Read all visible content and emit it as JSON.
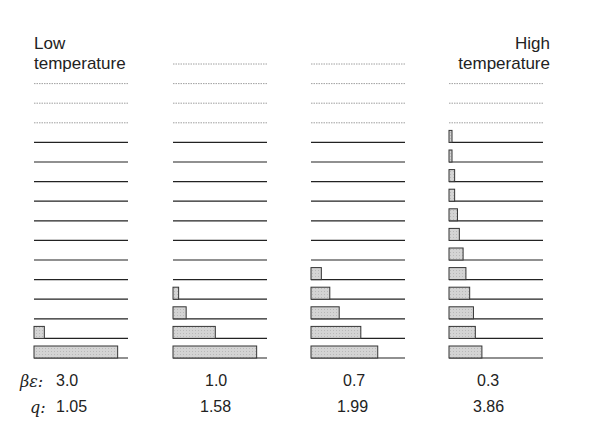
{
  "labels": {
    "low": [
      "Low",
      "temperature"
    ],
    "high": [
      "High",
      "temperature"
    ]
  },
  "rows": {
    "beta_epsilon_symbol": "βε:",
    "q_symbol": "q:"
  },
  "level_count": 16,
  "dotted_from_level": 12,
  "columns": [
    {
      "beta_epsilon": "3.0",
      "q": "1.05",
      "populations": [
        0.89,
        0.11,
        0,
        0,
        0,
        0,
        0,
        0,
        0,
        0,
        0,
        0,
        0,
        0,
        0,
        0
      ],
      "top_level": 14
    },
    {
      "beta_epsilon": "1.0",
      "q": "1.58",
      "populations": [
        0.89,
        0.45,
        0.14,
        0.06,
        0,
        0,
        0,
        0,
        0,
        0,
        0,
        0,
        0,
        0,
        0,
        0
      ],
      "top_level": 15
    },
    {
      "beta_epsilon": "0.7",
      "q": "1.99",
      "populations": [
        0.71,
        0.53,
        0.3,
        0.2,
        0.11,
        0,
        0,
        0,
        0,
        0,
        0,
        0,
        0,
        0,
        0,
        0
      ],
      "top_level": 15
    },
    {
      "beta_epsilon": "0.3",
      "q": "3.86",
      "populations": [
        0.35,
        0.28,
        0.26,
        0.22,
        0.18,
        0.15,
        0.11,
        0.09,
        0.06,
        0.06,
        0.03,
        0.03,
        0,
        0,
        0,
        0
      ],
      "top_level": 14
    }
  ],
  "colors": {
    "line": "#222222",
    "dotted": "#888888",
    "bar_fill": "#cfcfcf",
    "bar_stroke": "#333333"
  }
}
